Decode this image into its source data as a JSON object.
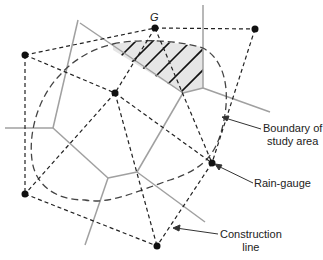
{
  "diagram": {
    "type": "thiessen-polygon",
    "gauge_label": "G",
    "labels": {
      "boundary_line1": "Boundary of",
      "boundary_line2": "study area",
      "rain_gauge": "Rain-gauge",
      "construction_line1": "Construction",
      "construction_line2": "line"
    },
    "gauges": [
      {
        "id": "G",
        "x": 155,
        "y": 28
      },
      {
        "id": "top-right",
        "x": 255,
        "y": 29
      },
      {
        "id": "left",
        "x": 25,
        "y": 55
      },
      {
        "id": "center",
        "x": 115,
        "y": 93
      },
      {
        "id": "right",
        "x": 212,
        "y": 163
      },
      {
        "id": "bottom-left",
        "x": 25,
        "y": 194
      },
      {
        "id": "bottom",
        "x": 157,
        "y": 246
      }
    ],
    "colors": {
      "construction": "#222222",
      "polygon": "#a0a0a0",
      "boundary": "#444444",
      "hatch_fill": "#e6e6e6"
    }
  }
}
